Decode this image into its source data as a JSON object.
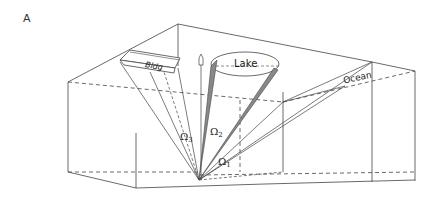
{
  "figure": {
    "panel_label": "A",
    "labels": {
      "building": "Bldg",
      "lake": "Lake",
      "ocean": "Ocean"
    },
    "angles": {
      "omega1": "Ω",
      "omega1_sub": "1",
      "omega2": "Ω",
      "omega2_sub": "2",
      "omega3": "Ω",
      "omega3_sub": "3"
    },
    "colors": {
      "line": "#333333",
      "shade": "#888888",
      "background": "#ffffff"
    }
  }
}
